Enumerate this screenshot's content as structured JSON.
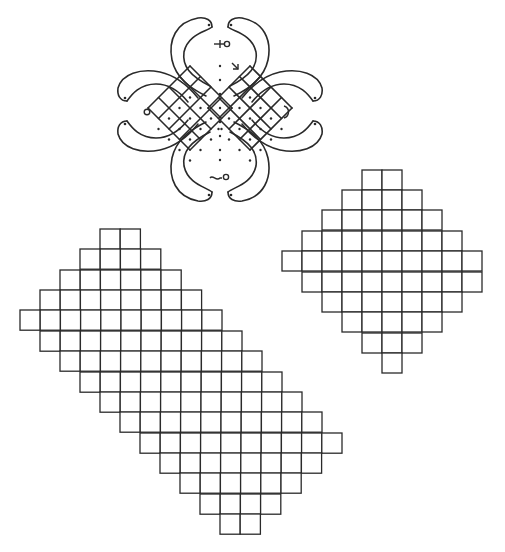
{
  "figure": {
    "type": "kolam-and-grid-diagrams",
    "stroke_color": "#2a2a2a",
    "background": "#ffffff"
  },
  "kolam": {
    "center": [
      220,
      108
    ],
    "center_dot_column_y": [
      66,
      80,
      94,
      108,
      122,
      136,
      150,
      160
    ],
    "lattices": [
      {
        "side": "left",
        "center": [
          190,
          108
        ],
        "half_diag": 42
      },
      {
        "side": "right",
        "center": [
          250,
          108
        ],
        "half_diag": 42
      }
    ],
    "symbols": [
      {
        "name": "top-arrow-circle",
        "position": [
          220,
          44
        ]
      },
      {
        "name": "left-circle",
        "position": [
          147,
          112
        ]
      },
      {
        "name": "right-crescent",
        "position": [
          285,
          112
        ]
      },
      {
        "name": "bottom-wave-circle",
        "position": [
          218,
          176
        ]
      },
      {
        "name": "start-arrow",
        "position": [
          238,
          66
        ]
      }
    ]
  },
  "grid_right": {
    "cell_size": 20,
    "rows": [
      {
        "y": 170,
        "x_start": 362,
        "cells": 2
      },
      {
        "y": 190,
        "x_start": 342,
        "cells": 4
      },
      {
        "y": 210,
        "x_start": 322,
        "cells": 6
      },
      {
        "y": 231,
        "x_start": 302,
        "cells": 8
      },
      {
        "y": 251,
        "x_start": 282,
        "cells": 10
      },
      {
        "y": 272,
        "x_start": 302,
        "cells": 9
      },
      {
        "y": 292,
        "x_start": 322,
        "cells": 7
      },
      {
        "y": 312,
        "x_start": 342,
        "cells": 5
      },
      {
        "y": 333,
        "x_start": 362,
        "cells": 3
      },
      {
        "y": 353,
        "x_start": 382,
        "cells": 1
      }
    ]
  },
  "grid_left": {
    "cell_size": 20.2,
    "rows": [
      {
        "y": 229,
        "x_start": 100,
        "cells": 2
      },
      {
        "y": 249,
        "x_start": 80,
        "cells": 4
      },
      {
        "y": 270,
        "x_start": 60,
        "cells": 6
      },
      {
        "y": 290,
        "x_start": 40,
        "cells": 8
      },
      {
        "y": 310,
        "x_start": 20,
        "cells": 10
      },
      {
        "y": 331,
        "x_start": 40,
        "cells": 10
      },
      {
        "y": 351,
        "x_start": 60,
        "cells": 10
      },
      {
        "y": 372,
        "x_start": 80,
        "cells": 10
      },
      {
        "y": 392,
        "x_start": 100,
        "cells": 10
      },
      {
        "y": 412,
        "x_start": 120,
        "cells": 10
      },
      {
        "y": 433,
        "x_start": 140,
        "cells": 10
      },
      {
        "y": 453,
        "x_start": 160,
        "cells": 8
      },
      {
        "y": 473,
        "x_start": 180,
        "cells": 6
      },
      {
        "y": 494,
        "x_start": 200,
        "cells": 4
      },
      {
        "y": 514,
        "x_start": 220,
        "cells": 2
      }
    ]
  }
}
